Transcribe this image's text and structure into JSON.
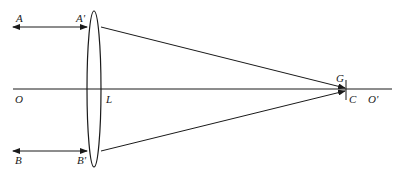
{
  "diagram": {
    "type": "optics-ray-diagram",
    "colors": {
      "line": "#1a1a1a",
      "background": "#ffffff"
    },
    "labels": {
      "A": "A",
      "A_prime": "A'",
      "B": "B",
      "B_prime": "B'",
      "O": "O",
      "L": "L",
      "G": "G",
      "C": "C",
      "O_prime": "O'"
    },
    "elements": {
      "optical_axis": {
        "from": "O",
        "to": "O'"
      },
      "lens": {
        "name": "L",
        "shape": "biconvex-ellipse"
      },
      "ray_upper": {
        "from": "A",
        "via": "A'",
        "to": "G"
      },
      "ray_lower": {
        "from": "B",
        "via": "B'",
        "to": "C"
      },
      "focal_marker": {
        "points": [
          "G",
          "C"
        ]
      }
    }
  }
}
